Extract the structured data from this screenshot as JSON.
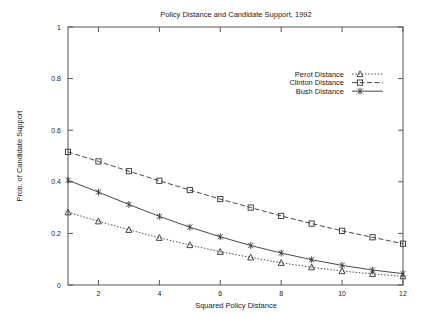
{
  "chart_data": {
    "type": "line",
    "title": "Policy Distance and Candidate Support, 1992",
    "xlabel": "Squared Policy Distance",
    "ylabel": "Prob. of Candidate Support",
    "x": [
      1,
      2,
      3,
      4,
      5,
      6,
      7,
      8,
      9,
      10,
      11,
      12
    ],
    "xlim": [
      1,
      12
    ],
    "ylim": [
      0,
      1
    ],
    "xticks": [
      2,
      4,
      6,
      8,
      10,
      12
    ],
    "yticks": [
      0,
      0.2,
      0.4,
      0.6,
      0.8,
      1
    ],
    "xtick_labels": [
      "2",
      "4",
      "6",
      "8",
      "10",
      "12"
    ],
    "ytick_labels": [
      "0",
      "0.2",
      "0.4",
      "0.6",
      "0.8",
      "1"
    ],
    "grid": false,
    "legend_position": "upper right",
    "series": [
      {
        "name": "Perot Distance",
        "marker": "triangle",
        "linestyle": "dotted",
        "color": "#333333",
        "values": [
          0.282,
          0.247,
          0.214,
          0.183,
          0.155,
          0.129,
          0.107,
          0.086,
          0.069,
          0.054,
          0.043,
          0.034
        ]
      },
      {
        "name": "Clinton Distance",
        "marker": "square",
        "linestyle": "dashed",
        "color": "#333333",
        "values": [
          0.516,
          0.479,
          0.441,
          0.404,
          0.368,
          0.333,
          0.3,
          0.268,
          0.238,
          0.21,
          0.185,
          0.16
        ]
      },
      {
        "name": "Bush Distance",
        "marker": "star",
        "linestyle": "solid",
        "color": "#333333",
        "values": [
          0.406,
          0.36,
          0.312,
          0.266,
          0.224,
          0.187,
          0.153,
          0.124,
          0.098,
          0.076,
          0.058,
          0.044
        ]
      }
    ]
  },
  "legend": {
    "entries": [
      {
        "label": "Perot Distance",
        "marker_name": "triangle-marker-icon"
      },
      {
        "label": "Clinton Distance",
        "marker_name": "square-marker-icon"
      },
      {
        "label": "Bush Distance",
        "marker_name": "star-marker-icon"
      }
    ]
  }
}
